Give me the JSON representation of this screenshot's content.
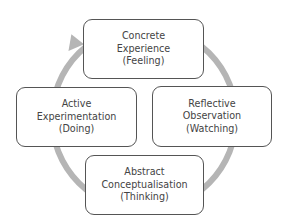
{
  "diagram": {
    "type": "cycle",
    "colors": {
      "ring": "#b5b5b5",
      "box_border": "#555555",
      "text": "#444444",
      "background": "#ffffff"
    },
    "stages": [
      {
        "id": "concrete",
        "lines": [
          "Concrete",
          "Experience",
          "(Feeling)"
        ]
      },
      {
        "id": "reflective",
        "lines": [
          "Reflective",
          "Observation",
          "(Watching)"
        ]
      },
      {
        "id": "abstract",
        "lines": [
          "Abstract",
          "Conceptualisation",
          "(Thinking)"
        ]
      },
      {
        "id": "active",
        "lines": [
          "Active",
          "Experimentation",
          "(Doing)"
        ]
      }
    ],
    "direction": "clockwise",
    "arrow": "arrowhead pointing from Active Experimentation to Concrete Experience"
  }
}
